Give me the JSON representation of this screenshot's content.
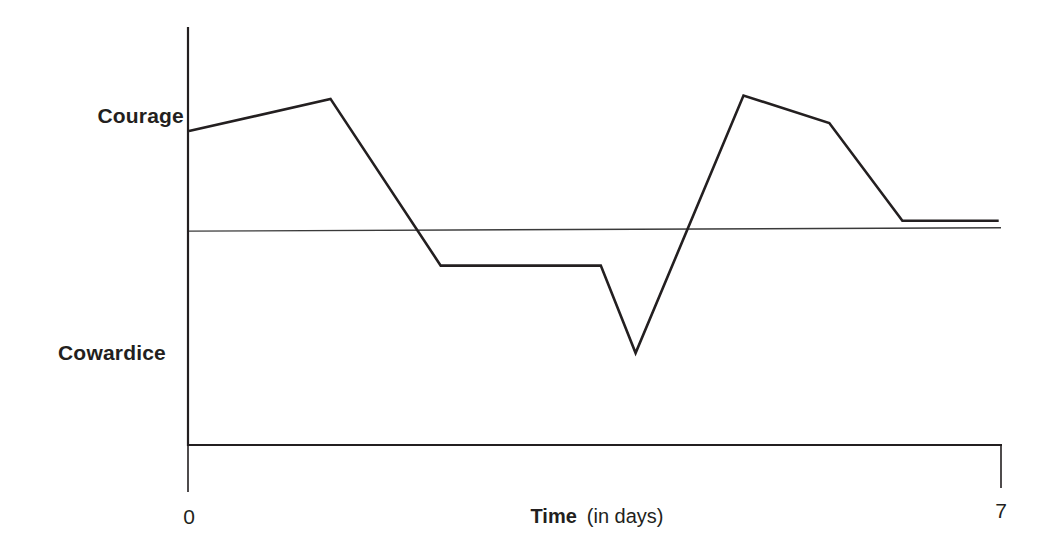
{
  "chart_data": {
    "type": "line",
    "title": "",
    "xlabel": "Time",
    "xlabel_suffix": "(in days)",
    "ylabel": "",
    "xlim": [
      0,
      7
    ],
    "x_ticks": [
      {
        "value": 0,
        "label": "0"
      },
      {
        "value": 7,
        "label": "7"
      }
    ],
    "y_category_labels": [
      {
        "value": 1,
        "label": "Courage"
      },
      {
        "value": -1,
        "label": "Cowardice"
      }
    ],
    "ylim": [
      -1.87,
      1.7
    ],
    "reference_line": {
      "name": "neutral",
      "y_start": -0.01,
      "y_end": 0.02
    },
    "grid": false,
    "legend": "none",
    "series": [
      {
        "name": "Character state",
        "color": "#231f20",
        "x": [
          0,
          1.22,
          2.17,
          3.55,
          3.85,
          4.78,
          5.52,
          6.15,
          6.98
        ],
        "y": [
          0.86,
          1.14,
          -0.31,
          -0.31,
          -1.07,
          1.17,
          0.93,
          0.08,
          0.08
        ]
      }
    ]
  },
  "colors": {
    "ink": "#231f20",
    "reference": "#3a3a3a",
    "background": "#ffffff"
  }
}
